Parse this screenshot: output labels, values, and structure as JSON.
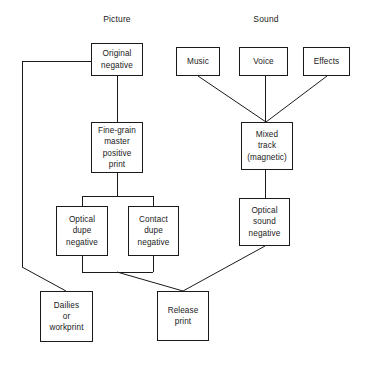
{
  "diagram": {
    "title_labels": {
      "picture": "Picture",
      "sound": "Sound"
    },
    "nodes": {
      "original_negative": "Original\nnegative",
      "fine_grain": "Fine-grain\nmaster\npositive\nprint",
      "optical_dupe": "Optical\ndupe\nnegative",
      "contact_dupe": "Contact\ndupe\nnegative",
      "dailies": "Dailies\nor\nworkprint",
      "release_print": "Release\nprint",
      "music": "Music",
      "voice": "Voice",
      "effects": "Effects",
      "mixed_track": "Mixed\ntrack\n(magnetic)",
      "optical_sound_negative": "Optical\nsound\nnegative"
    },
    "colors": {
      "stroke": "#1a1a1a",
      "background": "#ffffff",
      "text": "#1a1a1a"
    }
  }
}
